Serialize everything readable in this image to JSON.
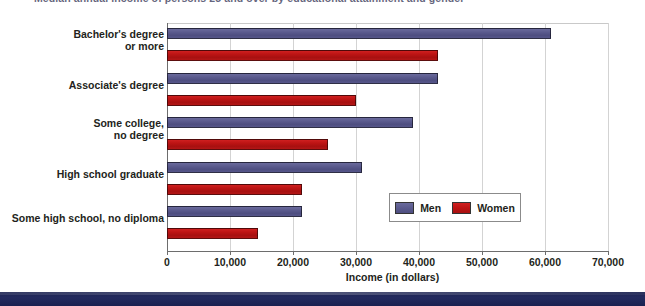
{
  "chart_data": {
    "type": "bar",
    "orientation": "horizontal",
    "title": "Median annual income of persons 25 and over by educational attainment and gender",
    "xlabel": "Income (in dollars)",
    "ylabel": "",
    "xlim": [
      0,
      70000
    ],
    "xticks": [
      "0",
      "10,000",
      "20,000",
      "30,000",
      "40,000",
      "50,000",
      "60,000",
      "70,000"
    ],
    "xtick_values": [
      0,
      10000,
      20000,
      30000,
      40000,
      50000,
      60000,
      70000
    ],
    "grid": true,
    "legend_position": "inside-right",
    "categories": [
      "Bachelor's degree\nor more",
      "Associate's degree",
      "Some college,\nno degree",
      "High school graduate",
      "Some high school, no diploma"
    ],
    "category_lines": [
      [
        "Bachelor's degree",
        "or more"
      ],
      [
        "Associate's degree"
      ],
      [
        "Some college,",
        "no degree"
      ],
      [
        "High school graduate"
      ],
      [
        "Some high school, no diploma"
      ]
    ],
    "series": [
      {
        "name": "Men",
        "color": "#5b5b8e",
        "values": [
          61000,
          43000,
          39000,
          31000,
          21500
        ]
      },
      {
        "name": "Women",
        "color": "#bd1414",
        "values": [
          43000,
          30000,
          25500,
          21500,
          14500
        ]
      }
    ]
  },
  "legend": {
    "items": [
      {
        "label": "Men",
        "swatch": "men"
      },
      {
        "label": "Women",
        "swatch": "women"
      }
    ]
  },
  "colors": {
    "men": "#5b5b8e",
    "women": "#bd1414",
    "band": "#1d2452",
    "text": "#231f20",
    "gridline": "#d3d3d3"
  }
}
